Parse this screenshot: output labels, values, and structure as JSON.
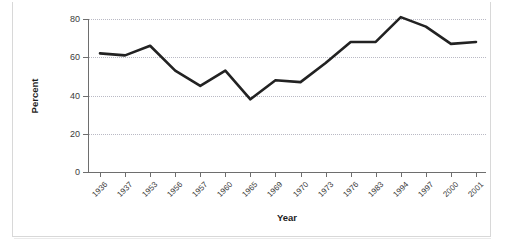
{
  "chart_data": {
    "type": "line",
    "title": "",
    "xlabel": "Year",
    "ylabel": "Percent",
    "categories": [
      "1936",
      "1937",
      "1953",
      "1956",
      "1957",
      "1960",
      "1965",
      "1969",
      "1970",
      "1973",
      "1976",
      "1983",
      "1994",
      "1997",
      "2000",
      "2001"
    ],
    "values": [
      62,
      61,
      66,
      53,
      45,
      53,
      38,
      48,
      47,
      57,
      68,
      68,
      81,
      76,
      67,
      68
    ],
    "series": [
      {
        "name": "Percent",
        "values": [
          62,
          61,
          66,
          53,
          45,
          53,
          38,
          48,
          47,
          57,
          68,
          68,
          81,
          76,
          67,
          68
        ],
        "color": "#222222"
      }
    ],
    "ylim": [
      0,
      80
    ],
    "yticks": [
      0,
      20,
      40,
      60,
      80
    ],
    "ytick_labels": [
      "0",
      "20",
      "40",
      "60",
      "80"
    ],
    "xtick_rotation": -45,
    "grid": "horizontal-dotted",
    "legend": "none",
    "line_width": 2.6,
    "markers": "none",
    "background": "#ffffff",
    "axis_color": "#6e6e6e",
    "grid_color": "#b9b9c4"
  },
  "figure": {
    "axis_titles": {
      "x": "Year",
      "y": "Percent"
    }
  }
}
